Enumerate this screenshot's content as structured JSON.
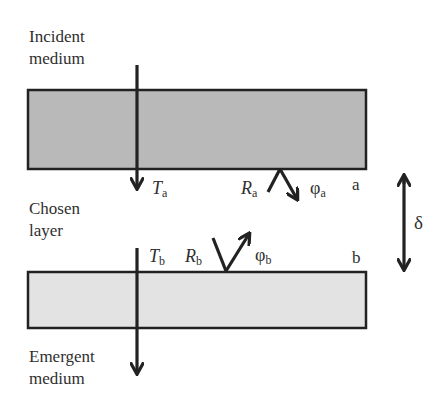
{
  "diagram": {
    "media": {
      "incident": [
        "Incident",
        "medium"
      ],
      "chosen": [
        "Chosen",
        "layer"
      ],
      "emergent": [
        "Emergent",
        "medium"
      ]
    },
    "interfaces": {
      "a": {
        "label": "a",
        "T": "T",
        "T_sub": "a",
        "R": "R",
        "R_sub": "a",
        "phi": "φ",
        "phi_sub": "a"
      },
      "b": {
        "label": "b",
        "T": "T",
        "T_sub": "b",
        "R": "R",
        "R_sub": "b",
        "phi": "φ",
        "phi_sub": "b"
      }
    },
    "thickness": {
      "symbol": "δ"
    },
    "colors": {
      "top_layer_fill": "#b9b9b9",
      "bottom_layer_fill": "#e3e3e3",
      "stroke": "#222222"
    }
  }
}
